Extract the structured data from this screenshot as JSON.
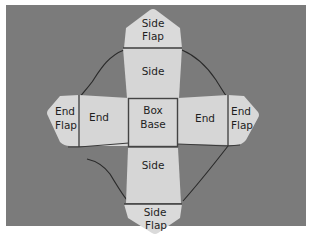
{
  "figure": {
    "colors": {
      "background": "#7b7b7b",
      "paper": "#d9d9d9",
      "paper_shadow": "#cfcfcf",
      "fold_line": "#3c3c3c",
      "thread": "#2a2a2a",
      "text": "#1e1e1e"
    },
    "labels": {
      "top_side_flap": [
        "Side",
        "Flap"
      ],
      "top_side": "Side",
      "left_end_flap": [
        "End",
        "Flap"
      ],
      "left_end": "End",
      "box_base": [
        "Box",
        "Base"
      ],
      "right_end": "End",
      "right_end_flap": [
        "End",
        "Flap"
      ],
      "bottom_side": "Side",
      "bottom_side_flap": [
        "Side",
        "Flap"
      ]
    }
  }
}
